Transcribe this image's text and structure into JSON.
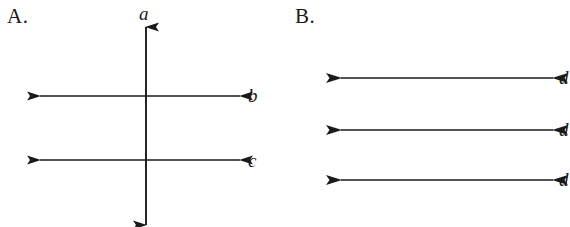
{
  "figure": {
    "width": 570,
    "height": 227,
    "background_color": "#ffffff",
    "stroke_color": "#1a1a1a"
  },
  "panels": [
    {
      "id": "A",
      "label": "A.",
      "description": "One vertical double-headed arrow crossed by two horizontal double-headed arrows",
      "lines": [
        {
          "name": "a",
          "label": "a",
          "orientation": "vertical",
          "label_position": "top"
        },
        {
          "name": "b",
          "label": "b",
          "orientation": "horizontal",
          "label_position": "right"
        },
        {
          "name": "c",
          "label": "c",
          "orientation": "horizontal",
          "label_position": "right"
        }
      ]
    },
    {
      "id": "B",
      "label": "B.",
      "description": "Three parallel horizontal double-headed arrows",
      "lines": [
        {
          "name": "d1",
          "label": "d",
          "orientation": "horizontal",
          "label_position": "right",
          "clipped": true
        },
        {
          "name": "d2",
          "label": "d",
          "orientation": "horizontal",
          "label_position": "right",
          "clipped": true
        },
        {
          "name": "d3",
          "label": "d",
          "orientation": "horizontal",
          "label_position": "right",
          "clipped": true
        }
      ]
    }
  ]
}
